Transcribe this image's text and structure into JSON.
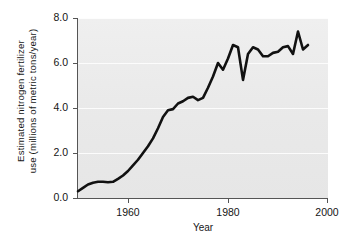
{
  "figure": {
    "background_color": "#ffffff",
    "plot_background_color": "#ececec",
    "line_color": "#111111"
  },
  "axes": {
    "y_title_line1": "Estimated nitrogen fertilizer",
    "y_title_line2": "use (millions of metric tons/year)",
    "x_title": "Year",
    "y_ticks": [
      "0.0",
      "2.0",
      "4.0",
      "6.0",
      "8.0"
    ],
    "x_ticks": [
      "1960",
      "1980",
      "2000"
    ]
  },
  "chart_data": {
    "type": "line",
    "title": "",
    "xlabel": "Year",
    "ylabel": "Estimated nitrogen fertilizer use (millions of metric tons/year)",
    "xlim": [
      1950,
      2000
    ],
    "ylim": [
      0.0,
      8.0
    ],
    "xticks": [
      1960,
      1980,
      2000
    ],
    "yticks": [
      0.0,
      2.0,
      4.0,
      6.0,
      8.0
    ],
    "grid": true,
    "legend": "none",
    "series": [
      {
        "name": "Estimated nitrogen fertilizer use",
        "x": [
          1950,
          1951,
          1952,
          1953,
          1954,
          1955,
          1956,
          1957,
          1958,
          1959,
          1960,
          1961,
          1962,
          1963,
          1964,
          1965,
          1966,
          1967,
          1968,
          1969,
          1970,
          1971,
          1972,
          1973,
          1974,
          1975,
          1976,
          1977,
          1978,
          1979,
          1980,
          1981,
          1982,
          1983,
          1984,
          1985,
          1986,
          1987,
          1988,
          1989,
          1990,
          1991,
          1992,
          1993,
          1994,
          1995,
          1996
        ],
        "values": [
          0.3,
          0.45,
          0.6,
          0.68,
          0.72,
          0.72,
          0.7,
          0.72,
          0.85,
          1.0,
          1.2,
          1.45,
          1.7,
          2.0,
          2.3,
          2.65,
          3.1,
          3.6,
          3.9,
          3.95,
          4.2,
          4.3,
          4.45,
          4.5,
          4.35,
          4.45,
          4.9,
          5.4,
          6.0,
          5.7,
          6.2,
          6.8,
          6.7,
          5.25,
          6.4,
          6.7,
          6.6,
          6.3,
          6.3,
          6.45,
          6.5,
          6.7,
          6.75,
          6.4,
          7.4,
          6.6,
          6.8
        ]
      }
    ]
  }
}
